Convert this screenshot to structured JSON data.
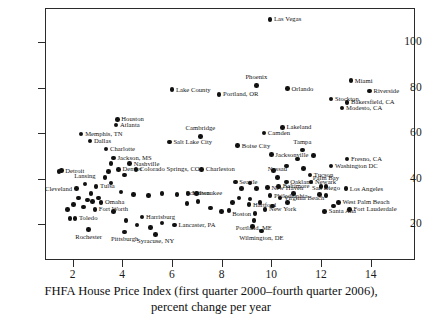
{
  "chart_data": {
    "type": "scatter",
    "title": "",
    "xlabel": "FHFA House Price Index (first quarter 2000–fourth quarter 2006), percent change per year",
    "ylabel": "",
    "xlim": [
      0.9,
      15.6
    ],
    "ylim": [
      6,
      118
    ],
    "xticks": [
      2,
      4,
      6,
      8,
      10,
      12,
      14
    ],
    "yticks": [
      20,
      40,
      60,
      80,
      100
    ],
    "grid": false,
    "legend": null,
    "points": [
      {
        "label": "Las Vegas",
        "x": 9.95,
        "y": 110.0,
        "pos": "r"
      },
      {
        "label": "Phoenix",
        "x": 9.4,
        "y": 81.0,
        "pos": "a"
      },
      {
        "label": "Miami",
        "x": 13.2,
        "y": 83.0,
        "pos": "r"
      },
      {
        "label": "Orlando",
        "x": 10.65,
        "y": 79.5,
        "pos": "r"
      },
      {
        "label": "Riverside",
        "x": 13.95,
        "y": 78.5,
        "pos": "r"
      },
      {
        "label": "Lake County",
        "x": 6.0,
        "y": 79.0,
        "pos": "r"
      },
      {
        "label": "Portland, OR",
        "x": 7.9,
        "y": 77.0,
        "pos": "r"
      },
      {
        "label": "Stockton",
        "x": 12.4,
        "y": 75.0,
        "pos": "r"
      },
      {
        "label": "Bakersfield, CA",
        "x": 13.05,
        "y": 73.5,
        "pos": "r"
      },
      {
        "label": "Modesto, CA",
        "x": 12.85,
        "y": 71.0,
        "pos": "r"
      },
      {
        "label": "Houston",
        "x": 3.8,
        "y": 66.0,
        "pos": "r"
      },
      {
        "label": "Atlanta",
        "x": 3.75,
        "y": 63.5,
        "pos": "r"
      },
      {
        "label": "Memphis, TN",
        "x": 2.35,
        "y": 59.5,
        "pos": "r"
      },
      {
        "label": "Lakeland",
        "x": 10.45,
        "y": 62.5,
        "pos": "r"
      },
      {
        "label": "Camden",
        "x": 9.7,
        "y": 60.0,
        "pos": "r"
      },
      {
        "label": "Cambridge",
        "x": 7.15,
        "y": 58.5,
        "pos": "a"
      },
      {
        "label": "Dallas",
        "x": 2.7,
        "y": 56.5,
        "pos": "r"
      },
      {
        "label": "Salt Lake City",
        "x": 5.9,
        "y": 56.0,
        "pos": "r"
      },
      {
        "label": "Boise City",
        "x": 8.65,
        "y": 54.5,
        "pos": "r"
      },
      {
        "label": "Charlotte",
        "x": 3.35,
        "y": 53.0,
        "pos": "r"
      },
      {
        "label": "Jacksonville",
        "x": 10.0,
        "y": 50.5,
        "pos": "r"
      },
      {
        "label": "Tampa",
        "x": 11.25,
        "y": 52.5,
        "pos": "a"
      },
      {
        "label": "Jackson, MS",
        "x": 3.65,
        "y": 49.0,
        "pos": "r"
      },
      {
        "label": "Fresno, CA",
        "x": 13.05,
        "y": 48.5,
        "pos": "r"
      },
      {
        "label": "Nashville",
        "x": 4.3,
        "y": 46.5,
        "pos": "r"
      },
      {
        "label": "Washington DC",
        "x": 12.4,
        "y": 45.5,
        "pos": "r"
      },
      {
        "label": "Denver",
        "x": 3.85,
        "y": 44.0,
        "pos": "r"
      },
      {
        "label": "Colorado Springs, CO",
        "x": 4.55,
        "y": 44.0,
        "pos": "r"
      },
      {
        "label": "Charleston",
        "x": 7.2,
        "y": 44.0,
        "pos": "r"
      },
      {
        "label": "Detroit",
        "x": 1.55,
        "y": 43.5,
        "pos": "r"
      },
      {
        "label": "Nassau",
        "x": 10.25,
        "y": 40.5,
        "pos": "a"
      },
      {
        "label": "Tucson",
        "x": 11.55,
        "y": 41.5,
        "pos": "r"
      },
      {
        "label": "Oakland",
        "x": 10.6,
        "y": 38.5,
        "pos": "r"
      },
      {
        "label": "Newark",
        "x": 11.6,
        "y": 38.5,
        "pos": "r"
      },
      {
        "label": "Seattle",
        "x": 8.55,
        "y": 38.5,
        "pos": "r"
      },
      {
        "label": "Lansing",
        "x": 2.5,
        "y": 37.5,
        "pos": "a"
      },
      {
        "label": "Tulsa",
        "x": 2.95,
        "y": 36.5,
        "pos": "r"
      },
      {
        "label": "Cleveland",
        "x": 2.15,
        "y": 35.5,
        "pos": "l"
      },
      {
        "label": "Baltimore",
        "x": 10.3,
        "y": 36.5,
        "pos": "r"
      },
      {
        "label": "Los Angeles",
        "x": 13.0,
        "y": 35.5,
        "pos": "r"
      },
      {
        "label": "Palm Bay",
        "x": 12.2,
        "y": 36.5,
        "pos": "a"
      },
      {
        "label": "New Haven",
        "x": 9.85,
        "y": 36.0,
        "pos": "r"
      },
      {
        "label": "Milwaukee",
        "x": 6.65,
        "y": 33.5,
        "pos": "r"
      },
      {
        "label": "Scranton",
        "x": 7.05,
        "y": 30.0,
        "pos": "a"
      },
      {
        "label": "San Diego",
        "x": 12.2,
        "y": 32.5,
        "pos": "a"
      },
      {
        "label": "Virginia Beach",
        "x": 10.35,
        "y": 31.5,
        "pos": "r"
      },
      {
        "label": "Philadelphia",
        "x": 9.95,
        "y": 32.5,
        "pos": "r"
      },
      {
        "label": "Omaha",
        "x": 3.15,
        "y": 29.5,
        "pos": "r"
      },
      {
        "label": "West Palm Beach",
        "x": 12.7,
        "y": 29.5,
        "pos": "r"
      },
      {
        "label": "Hartford",
        "x": 9.1,
        "y": 28.5,
        "pos": "r"
      },
      {
        "label": "Fort Worth",
        "x": 2.9,
        "y": 26.5,
        "pos": "r"
      },
      {
        "label": "Fort Lauderdale",
        "x": 13.15,
        "y": 26.5,
        "pos": "r"
      },
      {
        "label": "New York",
        "x": 9.75,
        "y": 26.5,
        "pos": "r"
      },
      {
        "label": "Santa Ana",
        "x": 12.15,
        "y": 25.5,
        "pos": "r"
      },
      {
        "label": "Boston",
        "x": 9.35,
        "y": 24.5,
        "pos": "l"
      },
      {
        "label": "Harrisburg",
        "x": 4.8,
        "y": 23.0,
        "pos": "r"
      },
      {
        "label": "Toledo",
        "x": 2.1,
        "y": 22.5,
        "pos": "r"
      },
      {
        "label": "Portland, ME",
        "x": 9.3,
        "y": 21.5,
        "pos": "b"
      },
      {
        "label": "Lancaster, PA",
        "x": 6.1,
        "y": 19.5,
        "pos": "r"
      },
      {
        "label": "Wilmington, DE",
        "x": 9.6,
        "y": 17.0,
        "pos": "b"
      },
      {
        "label": "Rochester",
        "x": 2.65,
        "y": 17.5,
        "pos": "b"
      },
      {
        "label": "Pittsburgh",
        "x": 4.1,
        "y": 16.5,
        "pos": "b"
      },
      {
        "label": "Syracuse, NY",
        "x": 5.35,
        "y": 15.5,
        "pos": "b"
      },
      {
        "label": "",
        "x": 1.45,
        "y": 43.0,
        "pos": "r"
      },
      {
        "label": "",
        "x": 3.55,
        "y": 46.5,
        "pos": "r"
      },
      {
        "label": "",
        "x": 3.45,
        "y": 43.0,
        "pos": "r"
      },
      {
        "label": "",
        "x": 3.3,
        "y": 40.5,
        "pos": "r"
      },
      {
        "label": "",
        "x": 3.55,
        "y": 38.0,
        "pos": "r"
      },
      {
        "label": "",
        "x": 4.1,
        "y": 41.5,
        "pos": "r"
      },
      {
        "label": "",
        "x": 2.75,
        "y": 33.5,
        "pos": "r"
      },
      {
        "label": "",
        "x": 3.95,
        "y": 34.0,
        "pos": "r"
      },
      {
        "label": "",
        "x": 4.45,
        "y": 33.0,
        "pos": "r"
      },
      {
        "label": "",
        "x": 5.05,
        "y": 32.5,
        "pos": "r"
      },
      {
        "label": "",
        "x": 5.6,
        "y": 33.5,
        "pos": "r"
      },
      {
        "label": "",
        "x": 6.2,
        "y": 33.0,
        "pos": "r"
      },
      {
        "label": "",
        "x": 7.0,
        "y": 33.5,
        "pos": "r"
      },
      {
        "label": "",
        "x": 2.25,
        "y": 31.5,
        "pos": "r"
      },
      {
        "label": "",
        "x": 2.6,
        "y": 30.5,
        "pos": "r"
      },
      {
        "label": "",
        "x": 2.05,
        "y": 28.5,
        "pos": "r"
      },
      {
        "label": "",
        "x": 2.45,
        "y": 27.5,
        "pos": "r"
      },
      {
        "label": "",
        "x": 2.8,
        "y": 30.0,
        "pos": "r"
      },
      {
        "label": "",
        "x": 3.05,
        "y": 31.5,
        "pos": "r"
      },
      {
        "label": "",
        "x": 1.8,
        "y": 26.5,
        "pos": "r"
      },
      {
        "label": "",
        "x": 1.9,
        "y": 22.5,
        "pos": "r"
      },
      {
        "label": "",
        "x": 3.65,
        "y": 25.5,
        "pos": "r"
      },
      {
        "label": "",
        "x": 4.15,
        "y": 21.5,
        "pos": "r"
      },
      {
        "label": "",
        "x": 4.6,
        "y": 19.5,
        "pos": "r"
      },
      {
        "label": "",
        "x": 5.15,
        "y": 18.5,
        "pos": "r"
      },
      {
        "label": "",
        "x": 5.6,
        "y": 20.5,
        "pos": "r"
      },
      {
        "label": "",
        "x": 6.6,
        "y": 29.0,
        "pos": "r"
      },
      {
        "label": "",
        "x": 7.55,
        "y": 27.0,
        "pos": "r"
      },
      {
        "label": "",
        "x": 8.0,
        "y": 25.5,
        "pos": "r"
      },
      {
        "label": "",
        "x": 8.45,
        "y": 29.5,
        "pos": "r"
      },
      {
        "label": "",
        "x": 8.3,
        "y": 26.0,
        "pos": "r"
      },
      {
        "label": "",
        "x": 8.7,
        "y": 31.5,
        "pos": "r"
      },
      {
        "label": "",
        "x": 9.15,
        "y": 31.0,
        "pos": "r"
      },
      {
        "label": "",
        "x": 9.4,
        "y": 35.5,
        "pos": "r"
      },
      {
        "label": "",
        "x": 8.8,
        "y": 35.5,
        "pos": "r"
      },
      {
        "label": "",
        "x": 9.15,
        "y": 38.0,
        "pos": "r"
      },
      {
        "label": "",
        "x": 9.55,
        "y": 29.5,
        "pos": "r"
      },
      {
        "label": "",
        "x": 9.25,
        "y": 19.0,
        "pos": "r"
      },
      {
        "label": "",
        "x": 10.1,
        "y": 43.5,
        "pos": "r"
      },
      {
        "label": "",
        "x": 10.6,
        "y": 45.5,
        "pos": "r"
      },
      {
        "label": "",
        "x": 11.05,
        "y": 48.5,
        "pos": "r"
      },
      {
        "label": "",
        "x": 11.3,
        "y": 44.5,
        "pos": "r"
      },
      {
        "label": "",
        "x": 11.7,
        "y": 50.0,
        "pos": "r"
      },
      {
        "label": "",
        "x": 12.0,
        "y": 36.5,
        "pos": "r"
      },
      {
        "label": "",
        "x": 11.95,
        "y": 33.0,
        "pos": "r"
      },
      {
        "label": "",
        "x": 10.9,
        "y": 33.5,
        "pos": "r"
      },
      {
        "label": "",
        "x": 10.65,
        "y": 29.5,
        "pos": "r"
      },
      {
        "label": "",
        "x": 10.05,
        "y": 28.0,
        "pos": "r"
      },
      {
        "label": "",
        "x": 12.5,
        "y": 28.0,
        "pos": "r"
      }
    ]
  },
  "axis": {
    "x_tick_labels": [
      "2",
      "4",
      "6",
      "8",
      "10",
      "12",
      "14"
    ],
    "y_tick_labels": [
      "20",
      "40",
      "60",
      "80",
      "100"
    ],
    "caption_line1": "FHFA House Price Index (first quarter 2000–fourth quarter 2006),",
    "caption_line2": "percent change per year"
  }
}
